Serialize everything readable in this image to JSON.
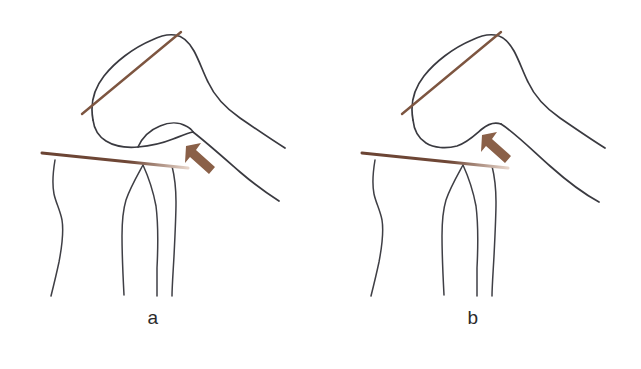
{
  "figure": {
    "background_color": "#ffffff",
    "width": 641,
    "height": 369,
    "type": "line-drawing-illustration"
  },
  "colors": {
    "bone_outline": "#3a3a40",
    "reference_line": "#6b4434",
    "reference_line_light": "#a67b62",
    "arrow": "#8a6048",
    "label_text": "#2b2b2b"
  },
  "panels": [
    {
      "id": "a",
      "label": "a",
      "description": "Knee with lens-shaped osteophyte at the anterior joint margin indicated by the arrow",
      "annotations": {
        "arrow": {
          "name": "osteophyte-arrow",
          "direction": "up-left",
          "color": "#8a6048"
        },
        "femoral_reference_line": {
          "name": "femoral-axis-reference-line",
          "orientation": "oblique",
          "color": "#6b4434"
        },
        "tibial_reference_line": {
          "name": "tibial-plateau-reference-line",
          "orientation": "near-horizontal",
          "color": "#6b4434"
        }
      },
      "features": [
        "femur-outline",
        "femoral-condyle-outline",
        "osteophyte-lens-shape",
        "tibia-outline",
        "fibula-outline"
      ]
    },
    {
      "id": "b",
      "label": "b",
      "description": "Knee with smooth normal anterior condylar contour indicated by the arrow",
      "annotations": {
        "arrow": {
          "name": "normal-contour-arrow",
          "direction": "up-left",
          "color": "#8a6048"
        },
        "femoral_reference_line": {
          "name": "femoral-axis-reference-line",
          "orientation": "oblique",
          "color": "#6b4434"
        },
        "tibial_reference_line": {
          "name": "tibial-plateau-reference-line",
          "orientation": "near-horizontal",
          "color": "#6b4434"
        }
      },
      "features": [
        "femur-outline",
        "femoral-condyle-outline",
        "smooth-condylar-notch",
        "tibia-outline",
        "fibula-outline"
      ]
    }
  ]
}
